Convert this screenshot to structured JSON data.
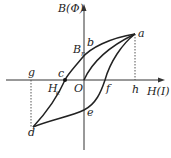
{
  "diagram": {
    "axes": {
      "y_label": "B(Φ)",
      "x_label": "H(I)",
      "origin_label": "O"
    },
    "points": {
      "a": "a",
      "b": "b",
      "c": "c",
      "d": "d",
      "e": "e",
      "f": "f",
      "g": "g",
      "h": "h"
    },
    "annotations": {
      "remanence": "B",
      "remanence_sub": "r",
      "coercivity": "H",
      "coercivity_sub": "c"
    }
  }
}
